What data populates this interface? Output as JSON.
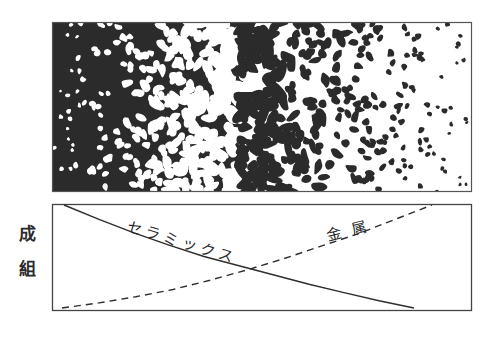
{
  "figure": {
    "microstructure_panel": {
      "description": "Graded microstructure: dark ceramic matrix with white metal particles on the left, transitioning to white metal matrix with dark ceramic particles on the right",
      "box": {
        "x": 52,
        "y": 22,
        "w": 420,
        "h": 170
      },
      "colors": {
        "dark_phase": "#2b2b2b",
        "light_phase": "#ffffff",
        "border": "#555555"
      }
    },
    "composition_panel": {
      "box": {
        "x": 52,
        "y": 204,
        "w": 420,
        "h": 107
      },
      "y_axis_label": [
        "組",
        "成"
      ],
      "y_axis_label_text": "組成",
      "curves": [
        {
          "name": "ceramics",
          "label": "セラミックス",
          "style": "solid",
          "from": "top-left",
          "to": "bottom-right"
        },
        {
          "name": "metal",
          "label": "金 属",
          "style": "dashed",
          "from": "bottom-left",
          "to": "top-right"
        }
      ],
      "colors": {
        "line": "#2e2e2e",
        "border": "#444444"
      }
    }
  },
  "chart_data": {
    "type": "line",
    "title": "",
    "xlabel": "",
    "ylabel": "組成",
    "x": [
      0,
      0.1,
      0.2,
      0.3,
      0.4,
      0.5,
      0.6,
      0.7,
      0.8,
      0.9,
      1.0
    ],
    "series": [
      {
        "name": "セラミックス",
        "style": "solid",
        "values": [
          1.0,
          0.86,
          0.73,
          0.61,
          0.5,
          0.41,
          0.32,
          0.23,
          0.15,
          0.07,
          0.0
        ]
      },
      {
        "name": "金属",
        "style": "dashed",
        "values": [
          0.0,
          0.05,
          0.11,
          0.18,
          0.27,
          0.37,
          0.48,
          0.6,
          0.72,
          0.86,
          1.0
        ]
      }
    ],
    "ylim": [
      0,
      1
    ],
    "grid": false,
    "legend": "inline labels on curves"
  }
}
